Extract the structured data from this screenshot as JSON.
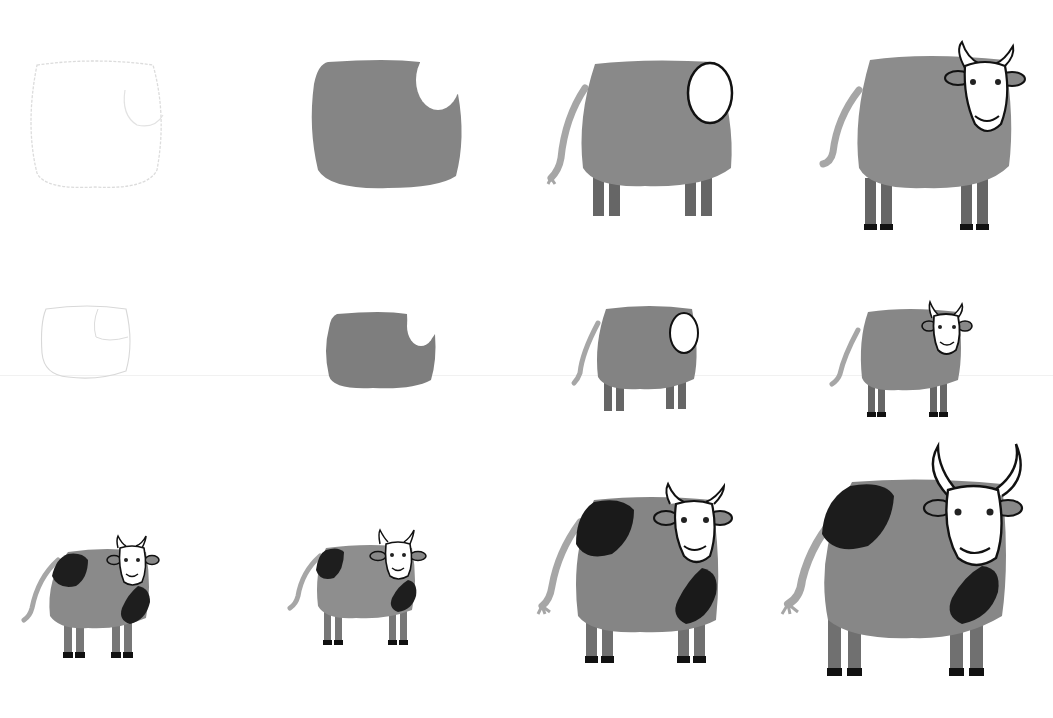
{
  "colors": {
    "background": "#ffffff",
    "body_gray": "#8a8a8a",
    "body_gray_dark": "#7a7a7a",
    "tail_gray": "#a8a8a8",
    "leg_gray": "#6e6e6e",
    "spot_black": "#1e1e1e",
    "outline": "#1a1a1a",
    "pencil": "#d8d8d8"
  },
  "rows": [
    {
      "name": "row-1-large",
      "steps": [
        {
          "step": 1,
          "desc": "pencil sketch of body and head",
          "x": 25,
          "y": 55,
          "w": 140,
          "h": 135,
          "stage": "sketch"
        },
        {
          "step": 2,
          "desc": "paint body gray leaving head white",
          "x": 310,
          "y": 60,
          "w": 155,
          "h": 130,
          "stage": "body"
        },
        {
          "step": 3,
          "desc": "add tail, legs and head outline",
          "x": 545,
          "y": 60,
          "w": 200,
          "h": 165,
          "stage": "legs"
        },
        {
          "step": 4,
          "desc": "add horns, ears, eyes, smile and hooves",
          "x": 815,
          "y": 40,
          "w": 215,
          "h": 200,
          "stage": "face"
        }
      ]
    },
    {
      "name": "row-2-small",
      "steps": [
        {
          "step": 1,
          "x": 38,
          "y": 305,
          "w": 95,
          "h": 75,
          "stage": "sketch"
        },
        {
          "step": 2,
          "x": 325,
          "y": 312,
          "w": 110,
          "h": 78,
          "stage": "body"
        },
        {
          "step": 3,
          "x": 570,
          "y": 305,
          "w": 135,
          "h": 110,
          "stage": "legs"
        },
        {
          "step": 4,
          "x": 828,
          "y": 302,
          "w": 150,
          "h": 120,
          "stage": "face"
        }
      ]
    },
    {
      "name": "row-3-spotted",
      "steps": [
        {
          "step": 1,
          "x": 18,
          "y": 535,
          "w": 145,
          "h": 130,
          "stage": "spotted"
        },
        {
          "step": 2,
          "x": 282,
          "y": 530,
          "w": 140,
          "h": 125,
          "stage": "spotted"
        },
        {
          "step": 3,
          "x": 530,
          "y": 480,
          "w": 210,
          "h": 190,
          "stage": "spotted"
        },
        {
          "step": 4,
          "x": 772,
          "y": 440,
          "w": 260,
          "h": 245,
          "stage": "spotted-bull"
        }
      ]
    }
  ]
}
